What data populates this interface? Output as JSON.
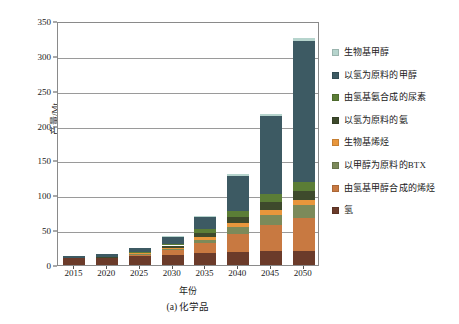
{
  "chart_data": {
    "type": "bar",
    "stacked": true,
    "title": "",
    "caption": "(a) 化学品",
    "xlabel": "年份",
    "ylabel": "产量/Mt",
    "categories": [
      "2015",
      "2020",
      "2025",
      "2030",
      "2035",
      "2040",
      "2045",
      "2050"
    ],
    "ylim": [
      0,
      350
    ],
    "yticks": [
      0,
      50,
      100,
      150,
      200,
      250,
      300,
      350
    ],
    "grid": true,
    "legend_position": "right",
    "series": [
      {
        "name": "氢",
        "color": "#6b3b2a",
        "values": [
          10,
          11,
          13,
          15,
          17,
          19,
          20,
          20
        ]
      },
      {
        "name": "由氢基甲醇合成的烯烃",
        "color": "#c87941",
        "values": [
          0,
          0,
          2,
          6,
          14,
          26,
          38,
          48
        ]
      },
      {
        "name": "以甲醇为原料的BTX",
        "color": "#7c8a5a",
        "values": [
          0,
          0,
          1,
          2,
          5,
          9,
          14,
          18
        ]
      },
      {
        "name": "生物基烯烃",
        "color": "#e8963c",
        "values": [
          0,
          0,
          1,
          2,
          4,
          6,
          7,
          7
        ]
      },
      {
        "name": "以氢为原料的氨",
        "color": "#3e4a2c",
        "values": [
          0,
          1,
          1,
          3,
          6,
          9,
          12,
          13
        ]
      },
      {
        "name": "由氢基氨合成的尿素",
        "color": "#5b7d36",
        "values": [
          0,
          0,
          1,
          2,
          5,
          8,
          11,
          13
        ]
      },
      {
        "name": "以氢为原料的甲醇",
        "color": "#3d5a63",
        "values": [
          3,
          4,
          5,
          11,
          18,
          50,
          112,
          203
        ]
      },
      {
        "name": "生物基甲醇",
        "color": "#b6d4cd",
        "values": [
          0,
          0,
          0,
          1,
          2,
          3,
          3,
          3
        ]
      }
    ],
    "totals": [
      13,
      16,
      24,
      42,
      71,
      130,
      217,
      325
    ]
  },
  "legend": {
    "items": [
      {
        "label": "生物基甲醇",
        "color": "#b6d4cd"
      },
      {
        "label": "以氢为原料的甲醇",
        "color": "#3d5a63"
      },
      {
        "label": "由氢基氨合成的尿素",
        "color": "#5b7d36"
      },
      {
        "label": "以氢为原料的氨",
        "color": "#3e4a2c"
      },
      {
        "label": "生物基烯烃",
        "color": "#e8963c"
      },
      {
        "label": "以甲醇为原料的BTX",
        "color": "#7c8a5a"
      },
      {
        "label": "由氢基甲醇合成的烯烃",
        "color": "#c87941"
      },
      {
        "label": "氢",
        "color": "#6b3b2a"
      }
    ]
  }
}
